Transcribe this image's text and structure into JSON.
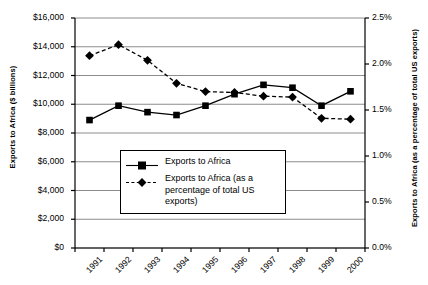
{
  "chart_data": {
    "type": "line",
    "title": "",
    "xlabel": "",
    "ylabel": "Exports to Africa ($ billions)",
    "ylabel_right": "Exports to Africa (as a percentage of total US exports)",
    "categories": [
      "1991",
      "1992",
      "1993",
      "1994",
      "1995",
      "1996",
      "1997",
      "1998",
      "1999",
      "2000"
    ],
    "ylim": [
      0,
      16000
    ],
    "yticks": [
      "$0",
      "$2,000",
      "$4,000",
      "$6,000",
      "$8,000",
      "$10,000",
      "$12,000",
      "$14,000",
      "$16,000"
    ],
    "ytick_values": [
      0,
      2000,
      4000,
      6000,
      8000,
      10000,
      12000,
      14000,
      16000
    ],
    "ylim_right": [
      0,
      2.5
    ],
    "yticks_right": [
      "0.0%",
      "0.5%",
      "1.0%",
      "1.5%",
      "2.0%",
      "2.5%"
    ],
    "ytick_values_right": [
      0.0,
      0.5,
      1.0,
      1.5,
      2.0,
      2.5
    ],
    "grid": true,
    "legend_position": "center-left-inside",
    "series": [
      {
        "name": "Exports to Africa",
        "axis": "left",
        "marker": "square",
        "line_style": "solid",
        "color": "#000000",
        "values": [
          8900,
          9900,
          9450,
          9250,
          9900,
          10700,
          11350,
          11150,
          9900,
          10900
        ]
      },
      {
        "name": "Exports to Africa (as a percentage of total US exports)",
        "axis": "right",
        "marker": "diamond",
        "line_style": "dashed",
        "color": "#000000",
        "values": [
          2.09,
          2.21,
          2.04,
          1.79,
          1.7,
          1.69,
          1.65,
          1.64,
          1.41,
          1.4
        ]
      }
    ]
  },
  "legend": {
    "items": [
      {
        "label": "Exports to Africa"
      },
      {
        "label": "Exports to Africa (as a percentage of total US exports)"
      }
    ]
  }
}
